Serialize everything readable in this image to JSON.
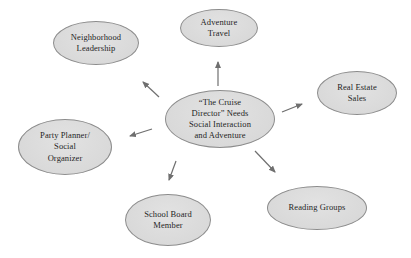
{
  "diagram": {
    "colors": {
      "background": "#ffffff",
      "node_fill": "#d8d8d8",
      "node_border": "#8c8c8c",
      "arrow_color": "#6f6f6f",
      "text_color": "#1f1f1f"
    },
    "center_node": {
      "id": "cruise-director",
      "lines": [
        "“The Cruise",
        "Director” Needs",
        "Social Interaction",
        "and Adventure"
      ]
    },
    "satellite_nodes": [
      {
        "id": "neighborhood-leadership",
        "lines": [
          "Neighborhood",
          "Leadership"
        ]
      },
      {
        "id": "adventure-travel",
        "lines": [
          "Adventure",
          "Travel"
        ]
      },
      {
        "id": "real-estate-sales",
        "lines": [
          "Real Estate",
          "Sales"
        ]
      },
      {
        "id": "party-planner-social-organizer",
        "lines": [
          "Party Planner/",
          "Social",
          "Organizer"
        ]
      },
      {
        "id": "school-board-member",
        "lines": [
          "School Board",
          "Member"
        ]
      },
      {
        "id": "reading-groups",
        "lines": [
          "Reading Groups"
        ]
      }
    ],
    "edges": [
      {
        "from": "cruise-director",
        "to": "adventure-travel"
      },
      {
        "from": "cruise-director",
        "to": "neighborhood-leadership"
      },
      {
        "from": "cruise-director",
        "to": "real-estate-sales"
      },
      {
        "from": "cruise-director",
        "to": "party-planner-social-organizer"
      },
      {
        "from": "cruise-director",
        "to": "school-board-member"
      },
      {
        "from": "cruise-director",
        "to": "reading-groups"
      }
    ]
  }
}
